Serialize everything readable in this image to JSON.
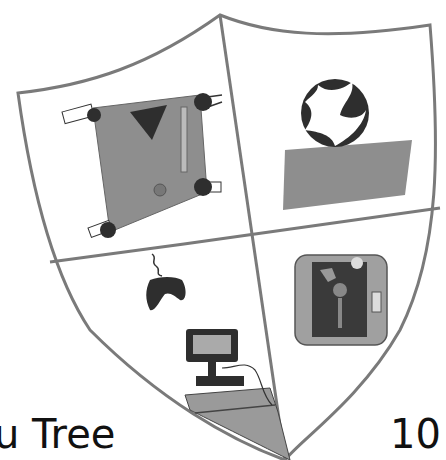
{
  "drawing": {
    "subject": "hand-drawn coat of arms shield",
    "quadrants": [
      {
        "position": "top-left",
        "item": "pool table"
      },
      {
        "position": "top-right",
        "item": "soccer ball on grass"
      },
      {
        "position": "bottom-left",
        "item": "game controller and computer"
      },
      {
        "position": "bottom-right",
        "item": "television"
      }
    ],
    "colors": {
      "outline": "#7a7a7a",
      "fill_gray": "#8e8e8e",
      "dark": "#2e2e2e",
      "paper": "#ffffff"
    }
  },
  "captions": {
    "left": "u Tree",
    "right": "10"
  }
}
